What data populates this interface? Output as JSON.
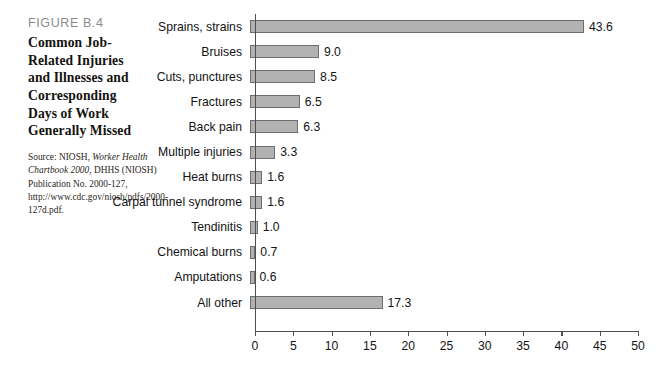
{
  "caption": {
    "figure_number": "FIGURE B.4",
    "title_lines": [
      "Common Job-",
      "Related Injuries",
      "and Illnesses and",
      "Corresponding",
      "Days of Work",
      "Generally Missed"
    ],
    "source_prefix": "Source: NIOSH, ",
    "source_italic": "Worker Health Chartbook 2000,",
    "source_rest": " DHHS (NIOSH) Publication No. 2000-127, http://www.cdc.gov/niosh/pdfs/2000-127d.pdf."
  },
  "colors": {
    "bar_fill": "#b2b2b2",
    "bar_border": "#6d6d6d",
    "axis": "#4f4f4f",
    "figure_number": "#8a8a8a",
    "text": "#131313"
  },
  "chart_data": {
    "type": "bar",
    "orientation": "horizontal",
    "xlabel": "",
    "ylabel": "",
    "xlim": [
      0,
      50
    ],
    "grid": false,
    "legend": false,
    "xticks": [
      0,
      5,
      10,
      15,
      20,
      25,
      30,
      35,
      40,
      45,
      50
    ],
    "xtick_labels": [
      "0",
      "5",
      "10",
      "15",
      "20",
      "25",
      "30",
      "35",
      "40",
      "45",
      "50"
    ],
    "categories": [
      "Sprains, strains",
      "Bruises",
      "Cuts, punctures",
      "Fractures",
      "Back pain",
      "Multiple injuries",
      "Heat burns",
      "Carpal tunnel syndrome",
      "Tendinitis",
      "Chemical burns",
      "Amputations",
      "All other"
    ],
    "values": [
      43.6,
      9.0,
      8.5,
      6.5,
      6.3,
      3.3,
      1.6,
      1.6,
      1.0,
      0.7,
      0.6,
      17.3
    ],
    "value_labels": [
      "43.6",
      "9.0",
      "8.5",
      "6.5",
      "6.3",
      "3.3",
      "1.6",
      "1.6",
      "1.0",
      "0.7",
      "0.6",
      "17.3"
    ]
  }
}
